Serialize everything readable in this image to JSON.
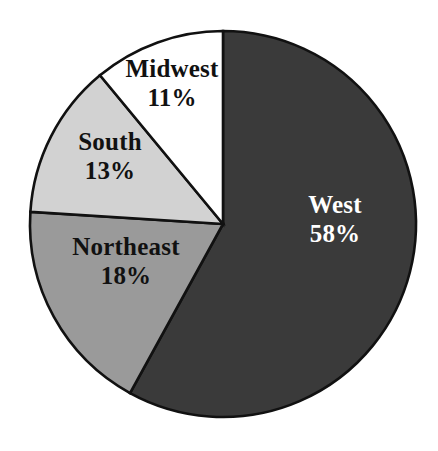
{
  "figure": {
    "background_color": "#ffffff",
    "outline_color": "#111111"
  },
  "chart_data": {
    "type": "pie",
    "title": "",
    "subtitle": "",
    "xlabel": "",
    "ylabel": "",
    "legend": "none",
    "grid": false,
    "units": "percent",
    "total": 100,
    "start_angle_deg": 0,
    "direction": "clockwise",
    "categories": [
      "West",
      "Northeast",
      "South",
      "Midwest"
    ],
    "values": [
      58,
      18,
      13,
      11
    ],
    "value_labels": [
      "58%",
      "18%",
      "13%",
      "11%"
    ],
    "slices": [
      {
        "name": "West",
        "value": 58,
        "value_label": "58%",
        "color": "#3a3a3a",
        "text_color": "#ffffff",
        "start_angle_deg": 0,
        "end_angle_deg": 208.8
      },
      {
        "name": "Northeast",
        "value": 18,
        "value_label": "18%",
        "color": "#9a9a9a",
        "text_color": "#111111",
        "start_angle_deg": 208.8,
        "end_angle_deg": 273.6
      },
      {
        "name": "South",
        "value": 13,
        "value_label": "13%",
        "color": "#d2d2d2",
        "text_color": "#111111",
        "start_angle_deg": 273.6,
        "end_angle_deg": 320.4
      },
      {
        "name": "Midwest",
        "value": 11,
        "value_label": "11%",
        "color": "#ffffff",
        "text_color": "#111111",
        "start_angle_deg": 320.4,
        "end_angle_deg": 360
      }
    ]
  }
}
